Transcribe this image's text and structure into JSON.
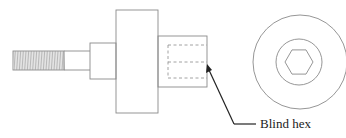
{
  "diagram": {
    "callouts": [
      {
        "id": "blind-hex",
        "label": "Blind hex"
      }
    ],
    "line_color": "#8a8a8a",
    "leader_color": "#222222"
  }
}
